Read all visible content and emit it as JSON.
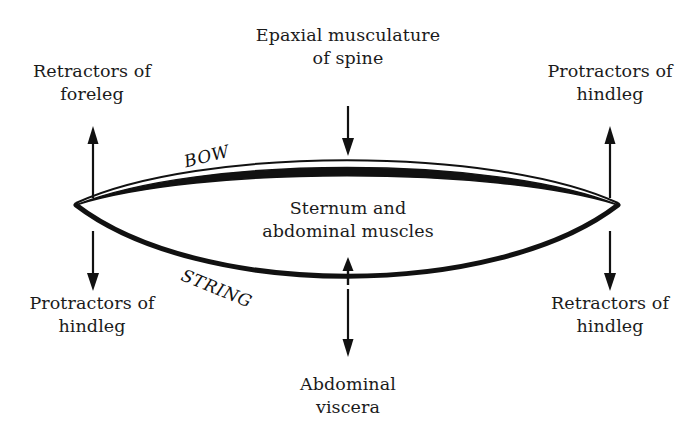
{
  "diagram": {
    "colors": {
      "ink": "#111111",
      "text": "#1b1b1b",
      "background": "#ffffff"
    },
    "curve_labels": {
      "bow": "BOW",
      "string": "STRING"
    },
    "labels": {
      "top_center": "Epaxial musculature\nof spine",
      "top_left": "Retractors of\nforeleg",
      "top_right": "Protractors of\nhindleg",
      "center": "Sternum and\nabdominal muscles",
      "bottom_left": "Protractors of\nhindleg",
      "bottom_right": "Retractors of\nhindleg",
      "bottom_center": "Abdominal\nviscera"
    },
    "arrows": [
      {
        "name": "arrow-top-left-up",
        "direction": "up"
      },
      {
        "name": "arrow-top-center-down",
        "direction": "down"
      },
      {
        "name": "arrow-top-right-up",
        "direction": "up"
      },
      {
        "name": "arrow-center-up",
        "direction": "up"
      },
      {
        "name": "arrow-center-down",
        "direction": "down"
      },
      {
        "name": "arrow-bottom-left-down",
        "direction": "down"
      },
      {
        "name": "arrow-bottom-right-down",
        "direction": "down"
      }
    ]
  }
}
